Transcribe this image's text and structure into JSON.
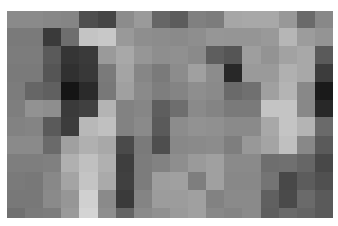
{
  "image": {
    "type": "pixelated-grayscale-mosaic",
    "columns": 18,
    "rows": 12,
    "background": "#ffffff",
    "grid": [
      [
        "#8a8a8a",
        "#8a8a8a",
        "#878787",
        "#858585",
        "#4e4e4e",
        "#454545",
        "#8c8c8c",
        "#9a9a9a",
        "#666666",
        "#5c5c5c",
        "#808080",
        "#7c7c7c",
        "#a6a6a6",
        "#a8a8a8",
        "#a8a8a8",
        "#989898",
        "#6a6a6a",
        "#888888"
      ],
      [
        "#7a7a7a",
        "#7a7a7a",
        "#3a3a3a",
        "#6e6e6e",
        "#c4c4c4",
        "#c8c8c8",
        "#999999",
        "#8e8e8e",
        "#8c8c8c",
        "#8a8a8a",
        "#8e8e8e",
        "#969696",
        "#959595",
        "#959595",
        "#999999",
        "#b6b6b6",
        "#9c9c9c",
        "#949494"
      ],
      [
        "#7c7c7c",
        "#7c7c7c",
        "#5a5a5a",
        "#353535",
        "#3a3a3a",
        "#9a9a9a",
        "#a8a8a8",
        "#969696",
        "#8e8e8e",
        "#909090",
        "#8a8a8a",
        "#5e5e5e",
        "#555555",
        "#9e9e9e",
        "#939393",
        "#a2a2a2",
        "#a8a8a8",
        "#5a5a5a"
      ],
      [
        "#7a7a7a",
        "#7a7a7a",
        "#555555",
        "#303030",
        "#383838",
        "#7a7a7a",
        "#a4a4a4",
        "#868686",
        "#7a7a7a",
        "#8c8c8c",
        "#a0a0a0",
        "#8c8c8c",
        "#282828",
        "#9a9a9a",
        "#9a9a9a",
        "#b0b0b0",
        "#a8a8a8",
        "#3c3c3c"
      ],
      [
        "#7c7c7c",
        "#666666",
        "#606060",
        "#151515",
        "#2a2a2a",
        "#787878",
        "#a0a0a0",
        "#8a8a8a",
        "#7e7e7e",
        "#848484",
        "#8e8e8e",
        "#8a8a8a",
        "#6a6a6a",
        "#707070",
        "#a0a0a0",
        "#b4b4b4",
        "#888888",
        "#1a1a1a"
      ],
      [
        "#7e7e7e",
        "#929292",
        "#8e8e8e",
        "#3a3a3a",
        "#404040",
        "#b4b4b4",
        "#828282",
        "#868686",
        "#5e5e5e",
        "#6e6e6e",
        "#8a8a8a",
        "#848484",
        "#7a7a7a",
        "#7a7a7a",
        "#c4c4c4",
        "#c4c4c4",
        "#888888",
        "#282828"
      ],
      [
        "#828282",
        "#848484",
        "#5a5a5a",
        "#3c3c3c",
        "#b8b8b8",
        "#c0c0c0",
        "#828282",
        "#8a8a8a",
        "#5a5a5a",
        "#8c8c8c",
        "#929292",
        "#909090",
        "#8a8a8a",
        "#8a8a8a",
        "#a8a8a8",
        "#c4c4c4",
        "#b4b4b4",
        "#6a6a6a"
      ],
      [
        "#8a8a8a",
        "#8a8a8a",
        "#6a6a6a",
        "#a0a0a0",
        "#b0b0b0",
        "#a8a8a8",
        "#4a4a4a",
        "#7a7a7a",
        "#4e4e4e",
        "#888888",
        "#8a8a8a",
        "#8c8c8c",
        "#7e7e7e",
        "#989898",
        "#a4a4a4",
        "#c0c0c0",
        "#888888",
        "#5a5a5a"
      ],
      [
        "#7e7e7e",
        "#7e7e7e",
        "#808080",
        "#b0b0b0",
        "#c0c0c0",
        "#b0b0b0",
        "#3e3e3e",
        "#7c7c7c",
        "#828282",
        "#8e8e8e",
        "#9a9a9a",
        "#a0a0a0",
        "#8a8a8a",
        "#8a8a8a",
        "#6e6e6e",
        "#707070",
        "#666666",
        "#484848"
      ],
      [
        "#7a7a7a",
        "#787878",
        "#888888",
        "#a4a4a4",
        "#c4c4c4",
        "#aaaaaa",
        "#404040",
        "#7c7c7c",
        "#9e9e9e",
        "#a0a0a0",
        "#7e7e7e",
        "#a0a0a0",
        "#888888",
        "#888888",
        "#747474",
        "#484848",
        "#5c5c5c",
        "#505050"
      ],
      [
        "#787878",
        "#787878",
        "#8a8a8a",
        "#969696",
        "#d0d0d0",
        "#8a8a8a",
        "#3a3a3a",
        "#848484",
        "#9c9c9c",
        "#9c9c9c",
        "#a0a0a0",
        "#828282",
        "#8a8a8a",
        "#8a8a8a",
        "#606060",
        "#4a4a4a",
        "#6a6a6a",
        "#5a5a5a"
      ],
      [
        "#707070",
        "#7a7a7a",
        "#7c7c7c",
        "#9a9a9a",
        "#d4d4d4",
        "#8e8e8e",
        "#646464",
        "#8a8a8a",
        "#909090",
        "#9a9a9a",
        "#a0a0a0",
        "#888888",
        "#848484",
        "#8a8a8a",
        "#5e5e5e",
        "#6a6a6a",
        "#646464",
        "#5a5a5a"
      ]
    ]
  }
}
